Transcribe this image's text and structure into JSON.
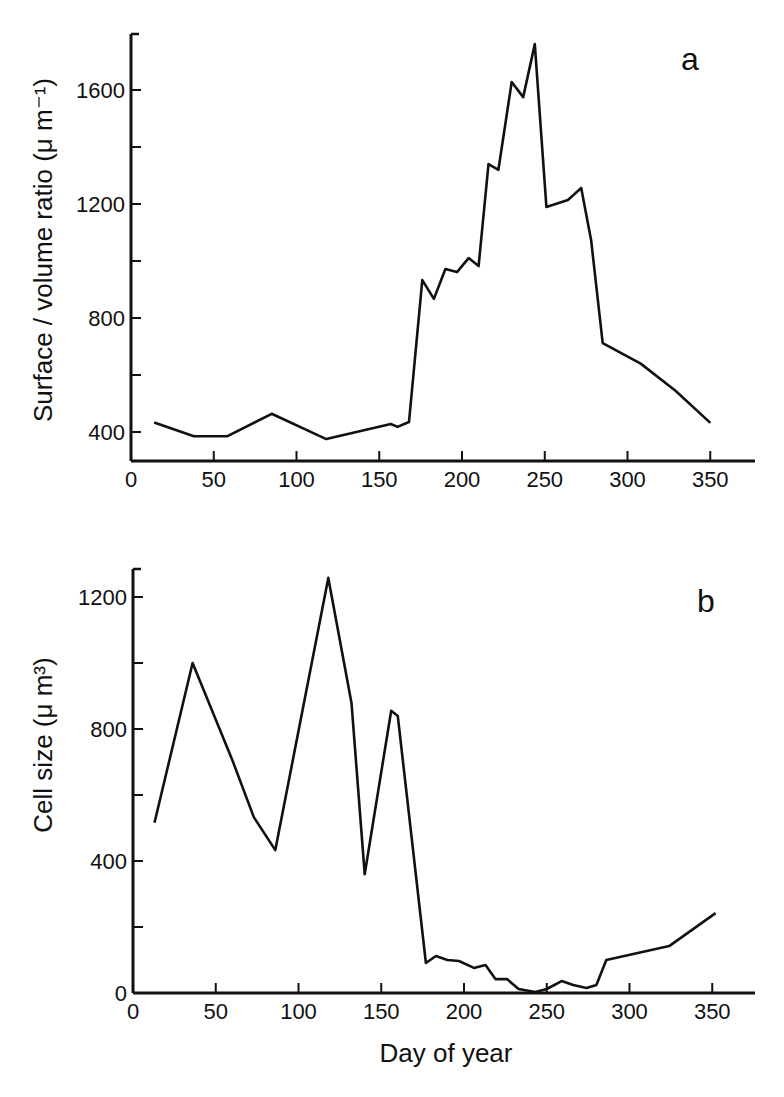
{
  "figure": {
    "xlabel": "Day of year",
    "panels": [
      {
        "id": "a",
        "label": "a",
        "ylabel": "Surface / volume ratio (μ m⁻¹)"
      },
      {
        "id": "b",
        "label": "b",
        "ylabel": "Cell size (μ m³)"
      }
    ]
  },
  "chart_data": [
    {
      "type": "line",
      "title": "a",
      "xlabel": "Day of year",
      "ylabel": "Surface / volume ratio (μm⁻¹)",
      "xlim": [
        0,
        375
      ],
      "ylim": [
        300,
        1800
      ],
      "xticks": [
        0,
        50,
        100,
        150,
        200,
        250,
        300,
        350
      ],
      "yticks": [
        400,
        800,
        1200,
        1600
      ],
      "yminor_ticks": [
        600,
        1000,
        1400
      ],
      "grid": false,
      "series": [
        {
          "name": "Surface/volume ratio",
          "x": [
            14,
            38,
            58,
            85,
            118,
            157,
            161,
            168,
            176,
            183,
            190,
            197,
            204,
            210,
            216,
            222,
            230,
            237,
            244,
            251,
            264,
            272,
            278,
            285,
            308,
            329,
            350
          ],
          "y": [
            433,
            385,
            385,
            464,
            375,
            428,
            418,
            435,
            933,
            867,
            972,
            961,
            1010,
            982,
            1340,
            1320,
            1628,
            1575,
            1761,
            1190,
            1214,
            1256,
            1074,
            712,
            640,
            545,
            432
          ]
        }
      ]
    },
    {
      "type": "line",
      "title": "b",
      "xlabel": "Day of year",
      "ylabel": "Cell size (μm³)",
      "xlim": [
        0,
        375
      ],
      "ylim": [
        0,
        1290
      ],
      "xticks": [
        0,
        50,
        100,
        150,
        200,
        250,
        300,
        350
      ],
      "yticks": [
        0,
        400,
        800,
        1200
      ],
      "yminor_ticks": [
        200,
        600,
        1000
      ],
      "grid": false,
      "series": [
        {
          "name": "Cell size",
          "x": [
            13,
            36,
            60,
            73,
            86,
            118,
            132,
            140,
            156,
            160,
            177,
            183,
            190,
            197,
            206,
            213,
            219,
            226,
            233,
            243,
            250,
            259,
            266,
            274,
            280,
            286,
            324,
            352
          ],
          "y": [
            516,
            1000,
            706,
            533,
            433,
            1258,
            879,
            360,
            855,
            839,
            91,
            112,
            100,
            97,
            76,
            85,
            42,
            42,
            12,
            3,
            12,
            36,
            24,
            15,
            24,
            100,
            142,
            242
          ]
        }
      ]
    }
  ]
}
